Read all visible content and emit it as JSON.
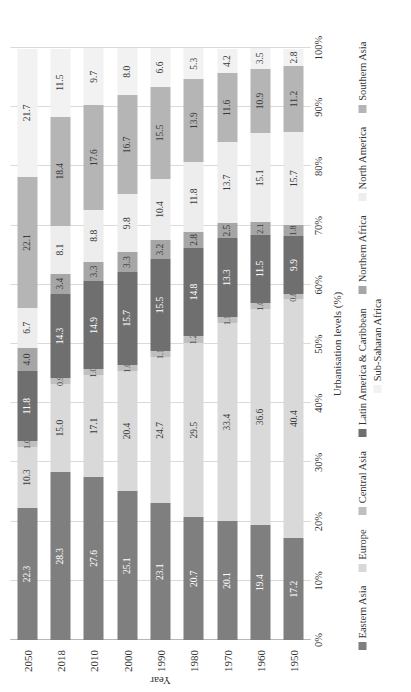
{
  "chart_data": {
    "type": "bar",
    "subtype": "100% stacked horizontal bar",
    "title": "",
    "xlabel": "Urbanisation levels (%)",
    "ylabel": "Year",
    "xlim": [
      0,
      100
    ],
    "grid": true,
    "legend_position": "bottom",
    "orientation": "horizontal-rotated-90",
    "xticks": [
      "0%",
      "10%",
      "20%",
      "30%",
      "40%",
      "50%",
      "60%",
      "70%",
      "80%",
      "90%",
      "100%"
    ],
    "xtick_values": [
      0,
      10,
      20,
      30,
      40,
      50,
      60,
      70,
      80,
      90,
      100
    ],
    "categories": [
      "2050",
      "2018",
      "2010",
      "2000",
      "1990",
      "1980",
      "1970",
      "1960",
      "1950"
    ],
    "series": [
      {
        "name": "Eastern Asia",
        "color": "#7f7f7f",
        "label_style": "dark",
        "values": [
          22.3,
          28.3,
          27.6,
          25.1,
          23.1,
          20.7,
          20.1,
          19.4,
          17.2
        ]
      },
      {
        "name": "Europe",
        "color": "#d9d9d9",
        "label_style": "light",
        "values": [
          10.3,
          15.0,
          17.1,
          20.4,
          24.7,
          29.5,
          33.4,
          36.6,
          40.4
        ]
      },
      {
        "name": "Central Asia",
        "color": "#bfbfbf",
        "label_style": "light",
        "values": [
          1.0,
          0.9,
          1.0,
          1.0,
          1.1,
          1.2,
          1.1,
          1.0,
          0.8
        ]
      },
      {
        "name": "Latin America & Caribbean",
        "color": "#6f6f6f",
        "label_style": "dark",
        "values": [
          11.8,
          14.3,
          14.9,
          15.7,
          15.5,
          14.8,
          13.3,
          11.5,
          9.9
        ]
      },
      {
        "name": "Northern Africa",
        "color": "#a6a6a6",
        "label_style": "light",
        "values": [
          4.0,
          3.4,
          3.3,
          3.3,
          3.2,
          2.8,
          2.5,
          2.1,
          1.8
        ]
      },
      {
        "name": "North America",
        "color": "#ededed",
        "label_style": "light",
        "values": [
          6.7,
          8.1,
          8.8,
          9.8,
          10.4,
          11.8,
          13.7,
          15.1,
          15.7
        ]
      },
      {
        "name": "Southern Asia",
        "color": "#b5b5b5",
        "label_style": "light",
        "values": [
          22.1,
          18.4,
          17.6,
          16.7,
          15.5,
          13.9,
          11.6,
          10.9,
          11.2
        ]
      },
      {
        "name": "Sub-Saharan Africa",
        "color": "#f2f2f2",
        "label_style": "light",
        "values": [
          21.7,
          11.5,
          9.7,
          8.0,
          6.6,
          5.3,
          4.2,
          3.5,
          2.8
        ]
      }
    ]
  },
  "axis": {
    "x_title": "Urbanisation levels (%)",
    "y_title": "Year"
  }
}
